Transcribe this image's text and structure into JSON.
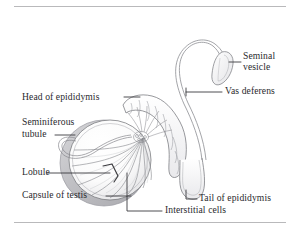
{
  "figure": {
    "type": "anatomical-line-illustration",
    "background_color": "#ffffff",
    "ink_color": "#6f7074",
    "text_color": "#2a2a2e",
    "rule_color": "#b9b9bb"
  },
  "labels": {
    "head_of_epididymis": "Head of epididymis",
    "seminiferous_tubule_line1": "Seminiferous",
    "seminiferous_tubule_line2": "tubule",
    "lobule": "Lobule",
    "capsule_of_testis": "Capsule of testis",
    "interstitial_cells": "Interstitial cells",
    "seminal_vesicle_line1": "Seminal",
    "seminal_vesicle_line2": "vesicle",
    "vas_deferens": "Vas deferens",
    "tail_of_epididymis": "Tail of epididymis"
  },
  "structures": [
    {
      "name": "testis",
      "description": "Circular sectioned testis showing radiating lobules"
    },
    {
      "name": "head-of-epididymis",
      "description": "Coiled segmented tube over superior testis"
    },
    {
      "name": "seminiferous-tubule",
      "description": "Thin unravelled tubule loop at left"
    },
    {
      "name": "lobule",
      "description": "Wedge-shaped compartment marked by bracket"
    },
    {
      "name": "capsule-of-testis",
      "description": "Outer tunica shell of testis"
    },
    {
      "name": "interstitial-cells",
      "description": "Tissue between seminiferous tubules"
    },
    {
      "name": "tail-of-epididymis",
      "description": "U-shaped inferior bend of epididymis"
    },
    {
      "name": "vas-deferens",
      "description": "Long tube arcing from tail up to seminal vesicle"
    },
    {
      "name": "seminal-vesicle",
      "description": "Small pod-shaped gland at upper right"
    }
  ]
}
